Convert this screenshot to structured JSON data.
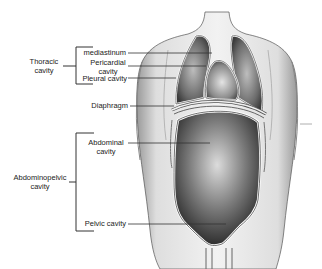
{
  "diagram": {
    "groups": [
      {
        "label": "Thoracic cavity",
        "line1": "Thoracic",
        "line2": "cavity",
        "members": [
          "mediastinum",
          "Pericardial cavity",
          "Pleural cavity"
        ]
      },
      {
        "label": "Abdominopelvic cavity",
        "line1": "Abdominopelvic",
        "line2": "cavity",
        "members": [
          "Abdominal cavity",
          "Pelvic cavity"
        ]
      }
    ],
    "labels": {
      "mediastinum": "mediastinum",
      "pericardial_1": "Pericardial",
      "pericardial_2": "cavity",
      "pleural": "Pleural cavity",
      "diaphragm": "Diaphragm",
      "abdominal_1": "Abdominal",
      "abdominal_2": "cavity",
      "pelvic": "Pelvic cavity"
    },
    "colors": {
      "line": "#333333",
      "skin": "#e8e8e8",
      "cavity_dark": "#3a3a3a",
      "cavity_light": "#d8d8d8",
      "background": "#ffffff"
    }
  }
}
